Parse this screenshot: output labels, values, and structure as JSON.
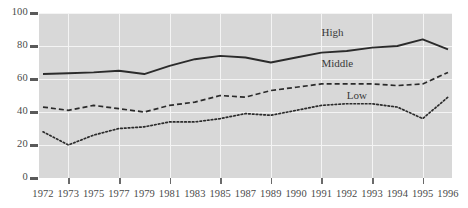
{
  "chart_data": {
    "type": "line",
    "title": "",
    "subtitle": "",
    "xlabel": "",
    "ylabel": "",
    "ylim": [
      0,
      100
    ],
    "yticks": [
      0,
      20,
      40,
      60,
      80,
      100
    ],
    "ytick_labels": [
      "0",
      "20",
      "40",
      "60",
      "80",
      "100"
    ],
    "grid": true,
    "legend_position": "inline-annotations",
    "categories": [
      "1972",
      "1973",
      "1975",
      "1977",
      "1979",
      "1981",
      "1983",
      "1985",
      "1987",
      "1989",
      "1990",
      "1991",
      "1992",
      "1993",
      "1994",
      "1995",
      "1996"
    ],
    "series": [
      {
        "name": "High",
        "style": "solid",
        "color": "#2b2b2b",
        "values": [
          63,
          63.5,
          64,
          65,
          63,
          68,
          72,
          74,
          73,
          70,
          73,
          76,
          77,
          79,
          80,
          84,
          78
        ],
        "annotation": "High",
        "annotation_x": "1991",
        "annotation_y": 88
      },
      {
        "name": "Middle",
        "style": "dashed",
        "color": "#2b2b2b",
        "values": [
          43,
          41,
          44,
          42,
          40,
          44,
          46,
          50,
          49,
          53,
          55,
          57,
          57,
          57,
          56,
          57,
          64
        ],
        "annotation": "Middle",
        "annotation_x": "1991",
        "annotation_y": 69
      },
      {
        "name": "Low",
        "style": "dotted",
        "color": "#2b2b2b",
        "values": [
          28,
          20,
          26,
          30,
          31,
          34,
          34,
          36,
          39,
          38,
          41,
          44,
          45,
          45,
          43,
          36,
          49
        ],
        "annotation": "Low",
        "annotation_x": "1992",
        "annotation_y": 50
      }
    ],
    "colors": {
      "plot_background": "#d8d8d8",
      "grid": "#f4f4f4",
      "line": "#2b2b2b",
      "text": "#4a4a4a",
      "page_background": "#ffffff"
    }
  }
}
